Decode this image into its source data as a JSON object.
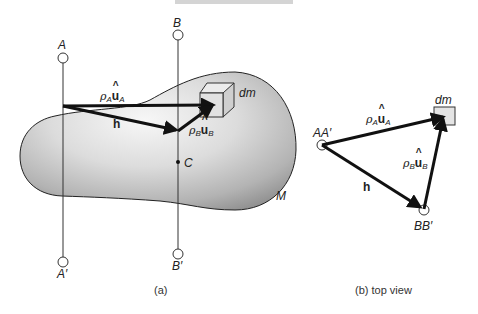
{
  "figure": {
    "top_bar_color": "#d4d4d4",
    "panel_a": {
      "caption": "(a)",
      "axis_A": {
        "top_label": "A",
        "bottom_label": "A′"
      },
      "axis_B": {
        "top_label": "B",
        "bottom_label": "B′"
      },
      "center_of_mass_label": "C",
      "body_label": "M",
      "mass_element_label": "dm",
      "vectors": {
        "rho_a": {
          "rho": "ρ",
          "sub": "A",
          "u": "u",
          "hat": "^",
          "usub": "A"
        },
        "rho_b": {
          "rho": "ρ",
          "sub": "B",
          "u": "u",
          "hat": "^",
          "usub": "B"
        },
        "h": "h"
      }
    },
    "panel_b": {
      "caption": "(b) top view",
      "point_AA_label": "AA′",
      "point_BB_label": "BB′",
      "mass_element_label": "dm",
      "vectors": {
        "rho_a": {
          "rho": "ρ",
          "sub": "A",
          "u": "u",
          "hat": "^",
          "usub": "A"
        },
        "rho_b": {
          "rho": "ρ",
          "sub": "B",
          "u": "u",
          "hat": "^",
          "usub": "B"
        },
        "h": "h"
      }
    },
    "colors": {
      "line": "#1a1a1a",
      "body_light": "#f2f2f2",
      "body_dark": "#9a9a9a",
      "cube_face": "#e2e2e2"
    }
  }
}
